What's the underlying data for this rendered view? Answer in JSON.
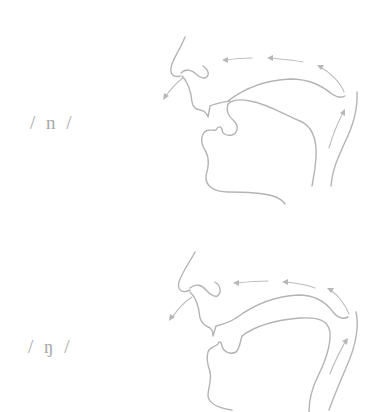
{
  "figure": {
    "type": "articulation diagram",
    "line_color": "#b4b4b4",
    "background": "#ffffff",
    "panels": [
      {
        "label": "/ n /",
        "phoneme": "n",
        "articulation": "alveolar nasal — tongue tip at alveolar ridge, velum lowered",
        "airflow": "up from throat, through nasal cavity, out the nose"
      },
      {
        "label": "/ ŋ /",
        "phoneme": "ŋ",
        "articulation": "velar nasal — back of tongue raised to soft palate, velum lowered",
        "airflow": "up from throat, through nasal cavity, out the nose"
      }
    ]
  }
}
